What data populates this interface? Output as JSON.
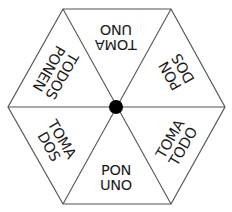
{
  "diagram": {
    "type": "hexagonal-spinning-top",
    "center_dot_color": "#000000",
    "line_color": "#555555",
    "faces": [
      {
        "position": "bottom",
        "line1": "PON",
        "line2": "UNO",
        "rotation": 0,
        "x": 116,
        "y": 178
      },
      {
        "position": "bottom-right",
        "line1": "TOMA",
        "line2": "TODO",
        "rotation": -60,
        "x": 177,
        "y": 143
      },
      {
        "position": "top-right",
        "line1": "PON",
        "line2": "DOS",
        "rotation": -120,
        "x": 177,
        "y": 72
      },
      {
        "position": "top",
        "line1": "TOMA",
        "line2": "UNO",
        "rotation": 180,
        "x": 116,
        "y": 37
      },
      {
        "position": "top-left",
        "line1": "TODOS",
        "line2": "PONEN",
        "rotation": 120,
        "x": 55,
        "y": 72
      },
      {
        "position": "bottom-left",
        "line1": "TOMA",
        "line2": "DOS",
        "rotation": 60,
        "x": 55,
        "y": 143
      }
    ]
  }
}
